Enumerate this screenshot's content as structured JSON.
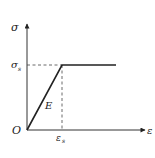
{
  "diagram": {
    "labels": {
      "y_axis": "σ",
      "x_axis": "ε",
      "origin": "O",
      "yield_stress": "σ",
      "yield_stress_sub": "s",
      "yield_strain": "ε",
      "yield_strain_sub": "s",
      "modulus": "E"
    },
    "colors": {
      "line": "#222222",
      "axis": "#333333",
      "dashed": "#444444"
    }
  }
}
